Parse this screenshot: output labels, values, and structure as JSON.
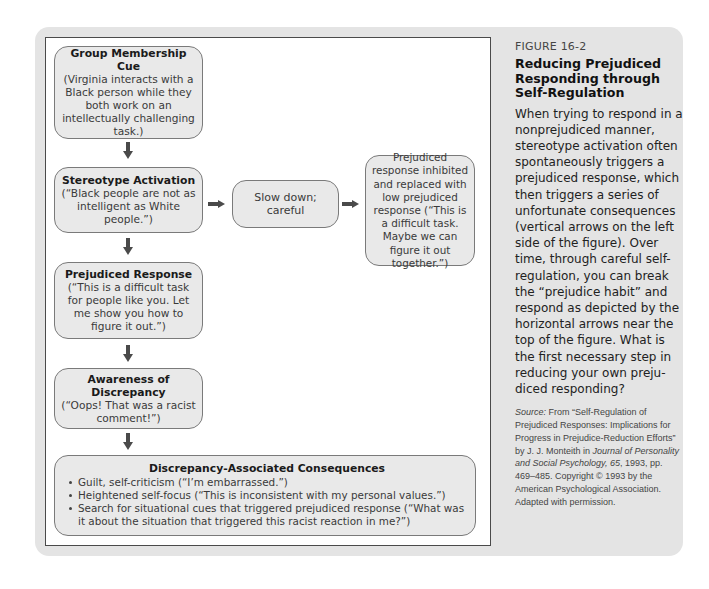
{
  "figure": {
    "label": "FIGURE 16-2",
    "title": "Reducing Prejudiced Responding through Self-Regulation",
    "description": "When trying to respond in a nonprejudiced manner, stereotype activation often spontaneously triggers a prejudiced response, which then triggers a series of unfortunate consequences (vertical arrows on the left side of the figure). Over time, through careful self-regulation, you can break the “prejudice habit” and respond as depicted by the horizontal arrows near the top of the figure. What is the first necessary step in reducing your own preju-diced responding?",
    "source": {
      "label": "Source:",
      "text_1": " From “Self-Regulation of Prejudiced Responses: Implications for Progress in Prejudice-Reduction Efforts” by J. J. Monteith in ",
      "journal": "Journal of Personality and Social Psychology, 65",
      "text_2": ", 1993, pp. 469–485. Copyright © 1993 by the American Psychological Association. Adapted with permission."
    }
  },
  "diagram": {
    "nodes": {
      "group_cue": {
        "title": "Group Membership Cue",
        "body": "(Virginia interacts with a Black person while they both work on an intellectually challenging task.)"
      },
      "stereotype": {
        "title": "Stereotype Activation",
        "body": "(“Black people are not as intelligent as White people.”)"
      },
      "slow_down": {
        "body": "Slow down; careful"
      },
      "inhibited": {
        "body": "Prejudiced response inhibited and replaced with low prejudiced response (“This is a difficult task. Maybe we can figure it out together.”)"
      },
      "prejudiced_response": {
        "title": "Prejudiced Response",
        "body": "(“This is a difficult task for people like you. Let me show you how to figure it out.”)"
      },
      "awareness": {
        "title": "Awareness of Discrepancy",
        "body": "(“Oops! That was a racist comment!”)"
      },
      "consequences": {
        "title": "Discrepancy-Associated Consequences",
        "items": [
          "Guilt, self-criticism (“I’m embarrassed.”)",
          "Heightened self-focus (“This is inconsistent with my personal values.”)",
          "Search for situational cues that triggered prejudiced response (“What was it about the situation that triggered this racist reaction in me?”)"
        ]
      }
    },
    "edges": [
      {
        "from": "group_cue",
        "to": "stereotype",
        "direction": "down"
      },
      {
        "from": "stereotype",
        "to": "prejudiced_response",
        "direction": "down"
      },
      {
        "from": "prejudiced_response",
        "to": "awareness",
        "direction": "down"
      },
      {
        "from": "awareness",
        "to": "consequences",
        "direction": "down"
      },
      {
        "from": "stereotype",
        "to": "slow_down",
        "direction": "right"
      },
      {
        "from": "slow_down",
        "to": "inhibited",
        "direction": "right"
      }
    ],
    "colors": {
      "panel": "#e4e4e4",
      "node_fill": "#e9e9e9",
      "node_border": "#7a7a7a",
      "arrow": "#4a4a4a"
    }
  }
}
